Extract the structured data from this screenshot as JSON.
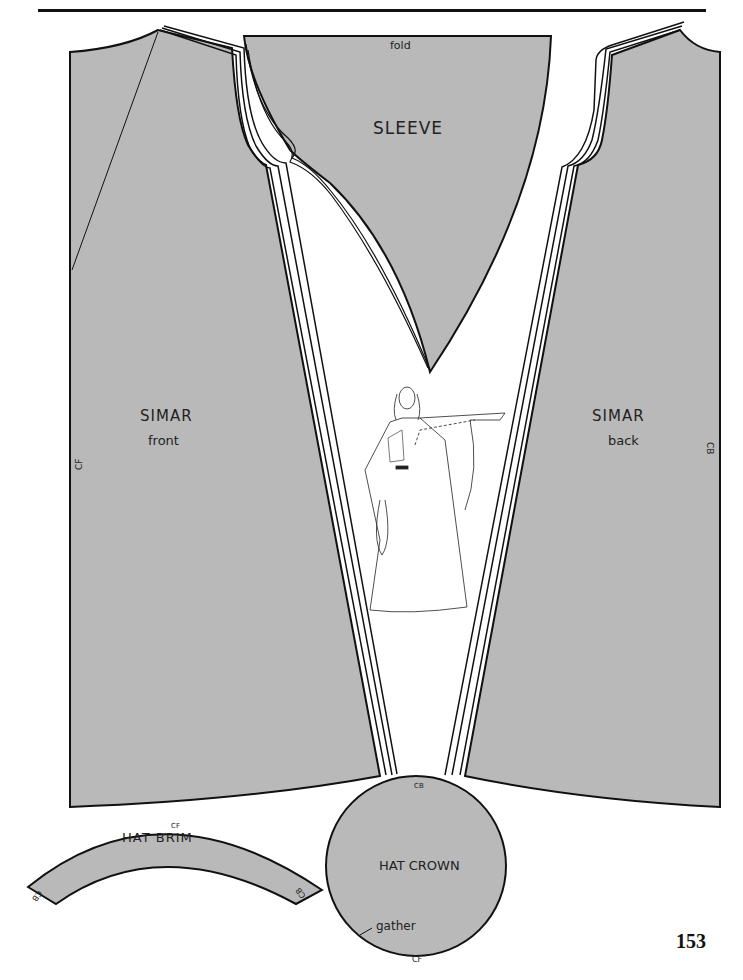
{
  "header": {
    "left_text": "Little Pattern",
    "right_text": ""
  },
  "pieces": {
    "sleeve": {
      "title": "SLEEVE",
      "fold_label": "fold"
    },
    "simar_front": {
      "title": "SIMAR",
      "subtitle": "front",
      "edge_label": "CF"
    },
    "simar_back": {
      "title": "SIMAR",
      "subtitle": "back",
      "edge_label": "CB"
    },
    "hat_brim": {
      "title": "HAT  BRIM",
      "top_label": "CF",
      "left_end_label": "CB",
      "right_end_label": "CB"
    },
    "hat_crown": {
      "title": "HAT CROWN",
      "top_label": "CB",
      "bottom_label": "CF",
      "note": "gather"
    }
  },
  "illustration": {
    "subject": "figure-in-simar-gown"
  },
  "colors": {
    "piece_fill": "#b9b9b9",
    "outline": "#111111",
    "background": "#ffffff"
  },
  "page_number": "153"
}
